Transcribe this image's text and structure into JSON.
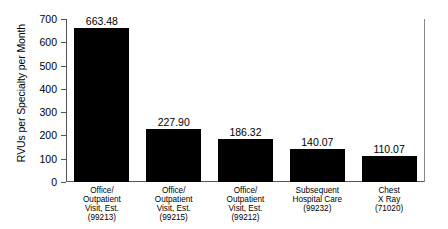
{
  "chart_data": {
    "type": "bar",
    "title": "",
    "xlabel": "",
    "ylabel": "RVUs per Specialty per Month",
    "ylim": [
      0,
      700
    ],
    "ytick_labels": [
      "700",
      "600",
      "500",
      "400",
      "300",
      "200",
      "100",
      "0"
    ],
    "yticks": [
      700,
      600,
      500,
      400,
      300,
      200,
      100,
      0
    ],
    "grid": false,
    "legend": null,
    "bar_color": "#000000",
    "categories": [
      "Office/ Outpatient Visit, Est. (99213)",
      "Office/ Outpatient Visit, Est. (99215)",
      "Office/ Outpatient Visit, Est. (99212)",
      "Subsequent Hospital Care (99232)",
      "Chest X Ray (71020)"
    ],
    "category_lines": [
      [
        "Office/",
        "Outpatient",
        "Visit, Est.",
        "(99213)"
      ],
      [
        "Office/",
        "Outpatient",
        "Visit, Est.",
        "(99215)"
      ],
      [
        "Office/",
        "Outpatient",
        "Visit, Est.",
        "(99212)"
      ],
      [
        "Subsequent",
        "Hospital Care",
        "(99232)"
      ],
      [
        "Chest",
        "X Ray",
        "(71020)"
      ]
    ],
    "values": [
      663.48,
      227.9,
      186.32,
      140.07,
      110.07
    ],
    "value_labels": [
      "663.48",
      "227.90",
      "186.32",
      "140.07",
      "110.07"
    ]
  }
}
